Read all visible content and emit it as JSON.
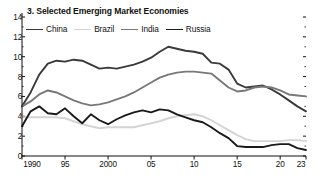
{
  "chart_data": {
    "type": "line",
    "title": "3. Selected Emerging Market Economies",
    "xlabel": "",
    "ylabel": "",
    "ylim": [
      0,
      14
    ],
    "xlim": [
      1990,
      2023
    ],
    "grid": false,
    "legend_position": "top-left",
    "y_ticks": [
      0,
      2,
      4,
      6,
      8,
      10,
      12,
      14
    ],
    "y_tick_labels": [
      "0",
      "2",
      "4",
      "6",
      "8",
      "10",
      "12",
      "14"
    ],
    "y_minor_ticks": [
      1,
      3,
      5,
      7,
      9,
      11,
      13
    ],
    "x_ticks": [
      1990,
      1995,
      2000,
      2005,
      2010,
      2015,
      2020,
      2023
    ],
    "x_tick_labels": [
      "1990",
      "95",
      "2000",
      "05",
      "10",
      "15",
      "20",
      "23"
    ],
    "x": [
      1990,
      1991,
      1992,
      1993,
      1994,
      1995,
      1996,
      1997,
      1998,
      1999,
      2000,
      2001,
      2002,
      2003,
      2004,
      2005,
      2006,
      2007,
      2008,
      2009,
      2010,
      2011,
      2012,
      2013,
      2014,
      2015,
      2016,
      2017,
      2018,
      2019,
      2020,
      2021,
      2022,
      2023
    ],
    "series": [
      {
        "name": "China",
        "color": "#3a3a3a",
        "width": 1.9,
        "values": [
          5.0,
          6.4,
          8.2,
          9.3,
          9.6,
          9.5,
          9.7,
          9.6,
          9.2,
          8.8,
          8.9,
          8.8,
          9.0,
          9.2,
          9.5,
          9.9,
          10.5,
          11.0,
          10.8,
          10.6,
          10.5,
          10.3,
          9.4,
          9.3,
          8.7,
          7.3,
          6.9,
          7.0,
          7.1,
          6.7,
          6.2,
          5.6,
          5.0,
          4.5
        ]
      },
      {
        "name": "Brazil",
        "color": "#d4d4d4",
        "width": 1.9,
        "values": [
          3.9,
          3.9,
          3.9,
          3.9,
          3.9,
          3.8,
          3.5,
          3.2,
          3.0,
          2.8,
          2.9,
          2.9,
          2.9,
          2.9,
          3.1,
          3.3,
          3.5,
          3.8,
          4.0,
          4.1,
          4.2,
          4.0,
          3.6,
          3.1,
          2.6,
          2.1,
          1.7,
          1.5,
          1.5,
          1.5,
          1.5,
          1.6,
          1.6,
          1.5
        ]
      },
      {
        "name": "India",
        "color": "#787878",
        "width": 1.9,
        "values": [
          5.0,
          5.5,
          6.2,
          6.6,
          6.4,
          6.0,
          5.6,
          5.3,
          5.1,
          5.2,
          5.4,
          5.7,
          6.0,
          6.4,
          6.9,
          7.4,
          7.9,
          8.2,
          8.4,
          8.5,
          8.5,
          8.4,
          8.3,
          7.6,
          6.9,
          6.5,
          6.6,
          6.9,
          7.0,
          6.9,
          6.6,
          6.2,
          6.1,
          6.0
        ]
      },
      {
        "name": "Russia",
        "color": "#1a1a1a",
        "width": 1.9,
        "values": [
          3.0,
          4.5,
          5.0,
          4.3,
          4.2,
          4.8,
          4.0,
          3.3,
          4.2,
          3.6,
          3.2,
          3.7,
          4.1,
          4.4,
          4.6,
          4.4,
          4.7,
          4.6,
          4.2,
          3.9,
          3.6,
          3.4,
          2.9,
          2.3,
          1.8,
          1.0,
          0.9,
          0.9,
          0.9,
          1.1,
          1.2,
          1.2,
          0.8,
          0.6
        ]
      }
    ]
  },
  "legend": {
    "entries": [
      {
        "label": "China"
      },
      {
        "label": "Brazil"
      },
      {
        "label": "India"
      },
      {
        "label": "Russia"
      }
    ]
  }
}
